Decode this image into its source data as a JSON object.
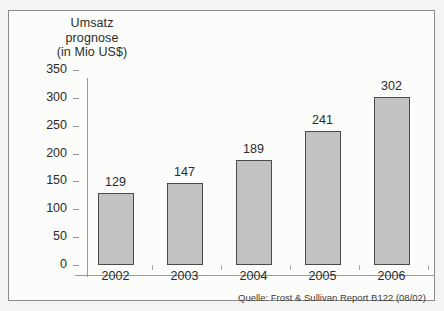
{
  "figure": {
    "title_lines": [
      "Umsatz",
      "prognose",
      "(in Mio US$)"
    ],
    "source_note": "Quelle: Frost & Sullivan Report B122 (08/02)",
    "bar_fill_color": "#c2c2c2",
    "bar_border_color": "#4a4a4a",
    "axis_color": "#9a9a9a",
    "frame_color": "#8c8c8c",
    "background_color": "#fcfcfb"
  },
  "chart_data": {
    "type": "bar",
    "title": "Umsatz prognose (in Mio US$)",
    "xlabel": "",
    "ylabel": "in Mio US$",
    "categories": [
      "2002",
      "2003",
      "2004",
      "2005",
      "2006"
    ],
    "values": [
      129,
      147,
      189,
      241,
      302
    ],
    "ylim": [
      0,
      350
    ],
    "yticks": [
      0,
      50,
      100,
      150,
      200,
      250,
      300,
      350
    ],
    "ytick_labels": [
      "0",
      "50",
      "100",
      "150",
      "200",
      "250",
      "300",
      "350"
    ],
    "grid": false,
    "legend": null,
    "data_labels": [
      "129",
      "147",
      "189",
      "241",
      "302"
    ],
    "annotations": [
      "Quelle: Frost & Sullivan Report B122 (08/02)"
    ]
  }
}
